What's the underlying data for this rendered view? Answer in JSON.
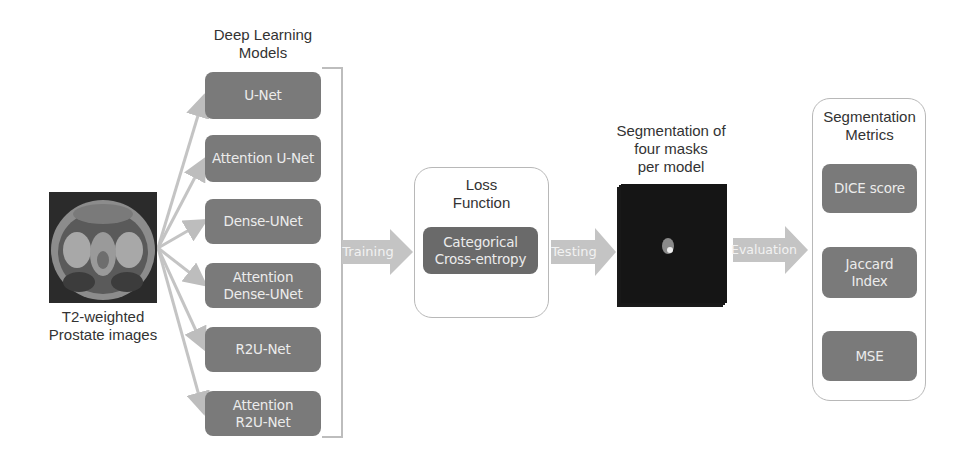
{
  "input": {
    "caption_line1": "T2-weighted",
    "caption_line2": "Prostate images",
    "image_icon": "mri-scan-image"
  },
  "models": {
    "title_line1": "Deep Learning",
    "title_line2": "Models",
    "items": [
      {
        "label": "U-Net"
      },
      {
        "label": "Attention U-Net"
      },
      {
        "label": "Dense-UNet"
      },
      {
        "label": "Attention Dense-UNet"
      },
      {
        "label": "R2U-Net"
      },
      {
        "label": "Attention R2U-Net"
      }
    ]
  },
  "arrows": {
    "training": "Training",
    "testing": "Testing",
    "evaluation": "Evaluation"
  },
  "loss": {
    "title_line1": "Loss",
    "title_line2": "Function",
    "item_line1": "Categorical",
    "item_line2": "Cross-entropy"
  },
  "segmentation": {
    "title_line1": "Segmentation of",
    "title_line2": "four masks",
    "title_line3": "per model",
    "image_icon": "segmentation-mask-stack"
  },
  "metrics": {
    "title_line1": "Segmentation",
    "title_line2": "Metrics",
    "items": [
      {
        "label": "DICE score"
      },
      {
        "label": "Jaccard Index"
      },
      {
        "label": "MSE"
      }
    ]
  },
  "colors": {
    "box_fill": "#7a7a7a",
    "box_text": "#ececec",
    "arrow_fill": "#c4c4c4",
    "outline": "#b8b8b8",
    "text": "#333333"
  }
}
